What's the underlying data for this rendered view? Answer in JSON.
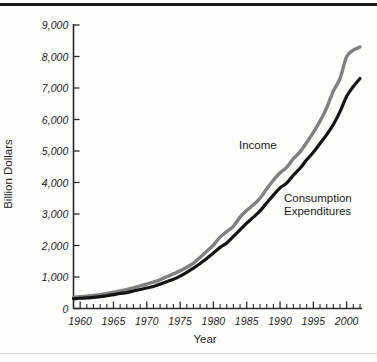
{
  "figure": {
    "background_color": "#fdfdfc",
    "top_rule_color": "#1a1a1a",
    "bottom_rule_color": "#d8d8d6"
  },
  "chart_data": {
    "type": "line",
    "title": "",
    "xlabel": "Year",
    "ylabel": "Billion Dollars",
    "xlim": [
      1959,
      2002
    ],
    "ylim": [
      0,
      9000
    ],
    "grid": false,
    "legend_position": "inline-annotations",
    "x_tick_labels": [
      "1960",
      "1965",
      "1970",
      "1975",
      "1980",
      "1985",
      "1990",
      "1995",
      "2000"
    ],
    "x_tick_values": [
      1960,
      1965,
      1970,
      1975,
      1980,
      1985,
      1990,
      1995,
      2000
    ],
    "x_minor_tick_step": 1,
    "y_tick_labels": [
      "0",
      "1,000",
      "2,000",
      "3,000",
      "4,000",
      "5,000",
      "6,000",
      "7,000",
      "8,000",
      "9,000"
    ],
    "y_tick_values": [
      0,
      1000,
      2000,
      3000,
      4000,
      5000,
      6000,
      7000,
      8000,
      9000
    ],
    "x": [
      1959,
      1960,
      1961,
      1962,
      1963,
      1964,
      1965,
      1966,
      1967,
      1968,
      1969,
      1970,
      1971,
      1972,
      1973,
      1974,
      1975,
      1976,
      1977,
      1978,
      1979,
      1980,
      1981,
      1982,
      1983,
      1984,
      1985,
      1986,
      1987,
      1988,
      1989,
      1990,
      1991,
      1992,
      1993,
      1994,
      1995,
      1996,
      1997,
      1998,
      1999,
      2000,
      2001,
      2002
    ],
    "series": [
      {
        "name": "Income",
        "color": "#808080",
        "values": [
          355,
          372,
          390,
          415,
          440,
          475,
          515,
          560,
          600,
          655,
          715,
          775,
          835,
          910,
          1010,
          1100,
          1195,
          1310,
          1440,
          1620,
          1815,
          2015,
          2265,
          2440,
          2610,
          2900,
          3110,
          3290,
          3500,
          3800,
          4070,
          4310,
          4480,
          4760,
          4970,
          5270,
          5590,
          5950,
          6370,
          6900,
          7300,
          8000,
          8200,
          8300
        ]
      },
      {
        "name": "Consumption Expenditures",
        "color": "#141414",
        "values": [
          310,
          325,
          335,
          355,
          375,
          405,
          440,
          475,
          505,
          555,
          605,
          650,
          700,
          770,
          850,
          930,
          1030,
          1150,
          1280,
          1430,
          1590,
          1760,
          1940,
          2080,
          2290,
          2500,
          2710,
          2900,
          3100,
          3350,
          3600,
          3830,
          3980,
          4230,
          4450,
          4720,
          4960,
          5240,
          5520,
          5840,
          6250,
          6740,
          7050,
          7300
        ]
      }
    ],
    "annotations": [
      {
        "text": "Income",
        "x": 1992,
        "y": 5050
      },
      {
        "text": "Consumption\nExpenditures",
        "x": 1996,
        "y": 3700
      }
    ]
  },
  "annotation_labels": {
    "income": "Income",
    "consumption_line1": "Consumption",
    "consumption_line2": "Expenditures"
  }
}
